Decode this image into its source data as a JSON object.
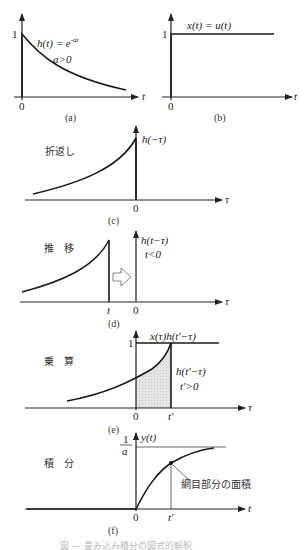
{
  "panels": {
    "a": {
      "caption": "(a)",
      "y_tick": "1",
      "origin": "0",
      "x_axis": "t",
      "formula": "h(t) = e",
      "formula_exp": "-at",
      "condition": "a>0"
    },
    "b": {
      "caption": "(b)",
      "y_tick": "1",
      "origin": "0",
      "x_axis": "t",
      "formula": "x(t) = u(t)"
    },
    "c": {
      "caption": "(c)",
      "step_label": "折返し",
      "curve_label": "h(−τ)",
      "origin": "0",
      "x_axis": "τ"
    },
    "d": {
      "caption": "(d)",
      "step_label": "推　移",
      "curve_label": "h(t−τ)",
      "condition": "t<0",
      "shift_tick": "t",
      "origin": "0",
      "x_axis": "τ"
    },
    "e": {
      "caption": "(e)",
      "step_label": "乗　算",
      "product_label": "x(τ)h(t′−τ)",
      "y_tick": "1",
      "curve_label": "h(t′−τ)",
      "condition": "t′>0",
      "origin": "0",
      "shift_tick": "t′",
      "x_axis": "τ"
    },
    "f": {
      "caption": "(f)",
      "step_label": "積　分",
      "y_label": "y(t)",
      "asymptote_num": "1",
      "asymptote_den": "a",
      "annotation": "網目部分の面積",
      "origin": "0",
      "shift_tick": "t′",
      "x_axis": "t"
    }
  },
  "figure_caption": "図 — 畳み込み積分の図式的解釈"
}
